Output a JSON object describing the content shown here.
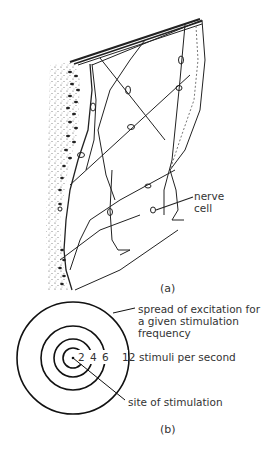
{
  "figure_a": {
    "label_nerve_cell_line1": "nerve",
    "label_nerve_cell_line2": "cell",
    "caption": "(a)"
  },
  "figure_b": {
    "label_spread_line1": "spread of excitation for",
    "label_spread_line2": "a given stimulation",
    "label_spread_line3": "frequency",
    "ring_values": [
      "2",
      "4",
      "6",
      "12"
    ],
    "ring_unit_label": "stimuli per second",
    "label_site": "site of stimulation",
    "caption": "(b)"
  }
}
